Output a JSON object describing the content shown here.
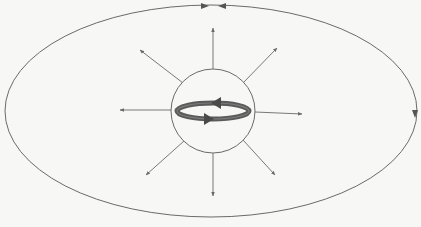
{
  "diagram": {
    "colors": {
      "background": "#f7f7f5",
      "line": "#6a6a6a",
      "loop": "#555555"
    },
    "outer_ellipse": {
      "cx": 211,
      "cy": 111,
      "rx": 206,
      "ry": 106
    },
    "center_circle": {
      "cx": 213,
      "cy": 111,
      "r": 42
    },
    "radial_arrows": [
      {
        "name": "up",
        "x1": 213,
        "y1": 69,
        "x2": 213,
        "y2": 28
      },
      {
        "name": "up-left",
        "x1": 183,
        "y1": 83,
        "x2": 140,
        "y2": 50
      },
      {
        "name": "up-right",
        "x1": 243,
        "y1": 83,
        "x2": 277,
        "y2": 48
      },
      {
        "name": "left",
        "x1": 171,
        "y1": 110,
        "x2": 120,
        "y2": 110
      },
      {
        "name": "right",
        "x1": 255,
        "y1": 112,
        "x2": 302,
        "y2": 114
      },
      {
        "name": "down-left",
        "x1": 184,
        "y1": 141,
        "x2": 146,
        "y2": 175
      },
      {
        "name": "down",
        "x1": 213,
        "y1": 153,
        "x2": 213,
        "y2": 196
      },
      {
        "name": "down-right",
        "x1": 243,
        "y1": 140,
        "x2": 275,
        "y2": 175
      }
    ],
    "ellipse_arrowheads": [
      {
        "name": "top-right-pointing",
        "x": 207,
        "y": 6,
        "dir": "right"
      },
      {
        "name": "top-left-pointing",
        "x": 220,
        "y": 6,
        "dir": "left"
      },
      {
        "name": "right-side-down",
        "x": 415,
        "y": 114,
        "dir": "down"
      }
    ]
  }
}
